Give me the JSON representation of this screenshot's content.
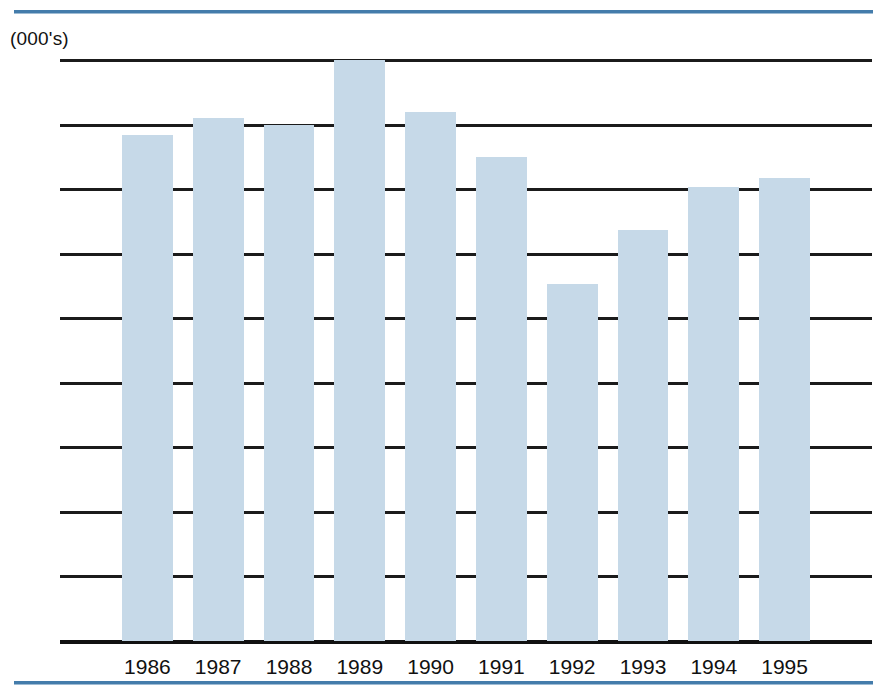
{
  "figure": {
    "units_label": "(000's)",
    "accent_rule_color": "#447cab",
    "bar_color": "#c6d9e8",
    "axis_color": "#111111"
  },
  "chart_data": {
    "type": "bar",
    "title": "",
    "subtitle": "",
    "xlabel": "",
    "ylabel": "(000's)",
    "categories": [
      "1986",
      "1987",
      "1988",
      "1989",
      "1990",
      "1991",
      "1992",
      "1993",
      "1994",
      "1995"
    ],
    "values": [
      235,
      243,
      240,
      270,
      246,
      225,
      166,
      191,
      211,
      215
    ],
    "series": [
      {
        "name": "",
        "values": [
          235,
          243,
          240,
          270,
          246,
          225,
          166,
          191,
          211,
          215
        ]
      }
    ],
    "ylim": [
      0,
      270
    ],
    "yticks": [
      0,
      30,
      60,
      90,
      120,
      150,
      180,
      210,
      240,
      270
    ],
    "ytick_labels": [
      "0",
      "30",
      "60",
      "90",
      "120",
      "150",
      "180",
      "210",
      "240",
      "270"
    ],
    "xtick_labels": [
      "1986",
      "1987",
      "1988",
      "1989",
      "1990",
      "1991",
      "1992",
      "1993",
      "1994",
      "1995"
    ],
    "grid": true,
    "grid_axis": "y",
    "legend": false,
    "legend_position": "none",
    "annotations": []
  }
}
